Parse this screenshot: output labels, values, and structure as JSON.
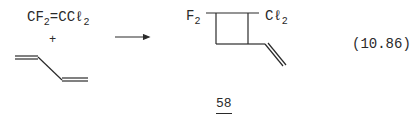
{
  "equation": {
    "reactant1": {
      "left": "CF",
      "left_sub": "2",
      "bond": "=",
      "right": "CCℓ",
      "right_sub": "2"
    },
    "plus": "+",
    "reactant2": "butadiene",
    "product": {
      "left_label": "F",
      "left_sub": "2",
      "right_label": "Cℓ",
      "right_sub": "2"
    },
    "number": "(10.86)"
  },
  "page_number": "58"
}
